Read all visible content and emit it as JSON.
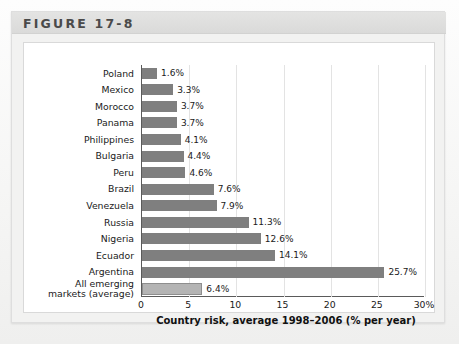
{
  "figure": {
    "title": "FIGURE 17-8"
  },
  "chart_data": {
    "type": "bar",
    "orientation": "horizontal",
    "title": "",
    "xlabel": "Country risk, average 1998–2006 (% per year)",
    "ylabel": "",
    "xlim": [
      0,
      30
    ],
    "xticks": [
      "0",
      "5",
      "10",
      "15",
      "20",
      "25",
      "30%"
    ],
    "xtick_values": [
      0,
      5,
      10,
      15,
      20,
      25,
      30
    ],
    "grid": "vertical",
    "legend": "none",
    "categories": [
      "Poland",
      "Mexico",
      "Morocco",
      "Panama",
      "Philippines",
      "Bulgaria",
      "Peru",
      "Brazil",
      "Venezuela",
      "Russia",
      "Nigeria",
      "Ecuador",
      "Argentina",
      "All emerging markets (average)"
    ],
    "category_lines": [
      [
        "Poland"
      ],
      [
        "Mexico"
      ],
      [
        "Morocco"
      ],
      [
        "Panama"
      ],
      [
        "Philippines"
      ],
      [
        "Bulgaria"
      ],
      [
        "Peru"
      ],
      [
        "Brazil"
      ],
      [
        "Venezuela"
      ],
      [
        "Russia"
      ],
      [
        "Nigeria"
      ],
      [
        "Ecuador"
      ],
      [
        "Argentina"
      ],
      [
        "All emerging",
        "markets (average)"
      ]
    ],
    "values": [
      1.6,
      3.3,
      3.7,
      3.7,
      4.1,
      4.4,
      4.6,
      7.6,
      7.9,
      11.3,
      12.6,
      14.1,
      25.7,
      6.4
    ],
    "value_labels": [
      "1.6%",
      "3.3%",
      "3.7%",
      "3.7%",
      "4.1%",
      "4.4%",
      "4.6%",
      "7.6%",
      "7.9%",
      "11.3%",
      "12.6%",
      "14.1%",
      "25.7%",
      "6.4%"
    ],
    "highlight_index": 13,
    "colors": {
      "bar": "#7f7f7f",
      "bar_highlight": "#b4b4b4",
      "axis": "#5a5a5a",
      "grid": "#e3e3e3",
      "panel": "#ffffff",
      "card": "#f2f2f1",
      "header_band": "#dadad9",
      "title_text": "#4a4a4a",
      "text": "#1a1a1a"
    }
  }
}
